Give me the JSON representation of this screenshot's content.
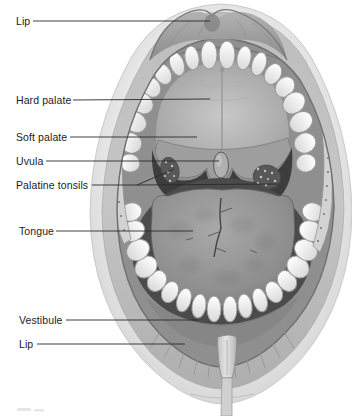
{
  "labels": {
    "lip_top": "Lip",
    "hard_palate": "Hard palate",
    "soft_palate": "Soft palate",
    "uvula": "Uvula",
    "palatine_tonsils": "Palatine tonsils",
    "tongue": "Tongue",
    "vestibule": "Vestibule",
    "lip_bottom": "Lip"
  },
  "colors": {
    "background": "#ffffff",
    "label_text": "#1c1c1c",
    "leader_line": "#2a2a2a",
    "illustration_dark": "#3d3d3d",
    "illustration_mid": "#9a9a9a",
    "illustration_light": "#ececec"
  }
}
